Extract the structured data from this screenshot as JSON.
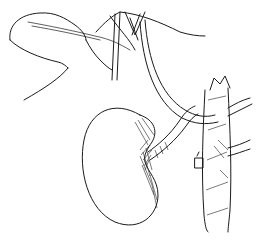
{
  "image": {
    "subject": "anatomical line drawing",
    "width": 262,
    "height": 251,
    "colors": {
      "background": "#ffffff",
      "ink": "#1a1a1a",
      "shade": "#222222"
    },
    "elements": [
      {
        "name": "liver-lobe-outline"
      },
      {
        "name": "vessel-branches"
      },
      {
        "name": "kidney"
      },
      {
        "name": "renal-vessel"
      },
      {
        "name": "aorta-trunk"
      },
      {
        "name": "ligated-vessel-stub"
      }
    ]
  }
}
